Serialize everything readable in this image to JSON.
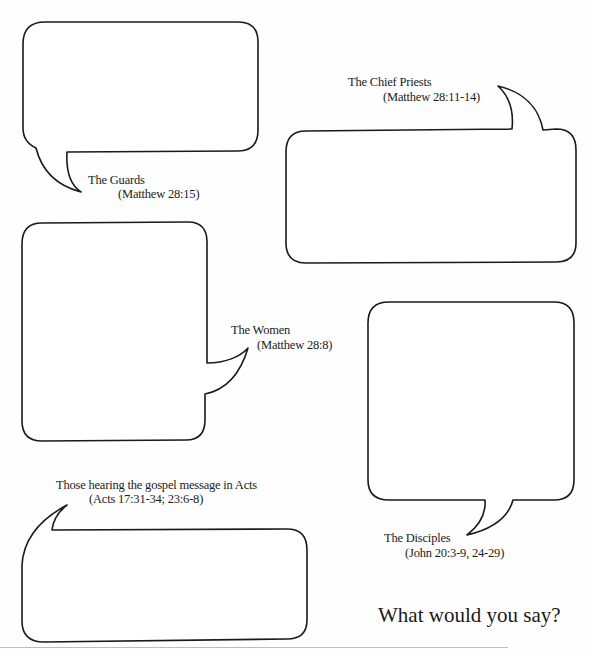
{
  "colors": {
    "stroke": "#1a1a1a",
    "text": "#1c1c1c",
    "background": "#ffffff",
    "rule": "#bdbdbd"
  },
  "bubbles": [
    {
      "id": "guards",
      "label": "The Guards",
      "reference": "(Matthew 28:15)",
      "response": ""
    },
    {
      "id": "chief-priests",
      "label": "The Chief Priests",
      "reference": "(Matthew 28:11-14)",
      "response": ""
    },
    {
      "id": "women",
      "label": "The Women",
      "reference": "(Matthew 28:8)",
      "response": ""
    },
    {
      "id": "disciples",
      "label": "The Disciples",
      "reference": "(John 20:3-9, 24-29)",
      "response": ""
    },
    {
      "id": "acts-hearers",
      "label": "Those hearing the gospel message in Acts",
      "reference": "(Acts 17:31-34; 23:6-8)",
      "response": ""
    }
  ],
  "prompt": "What would you say?"
}
